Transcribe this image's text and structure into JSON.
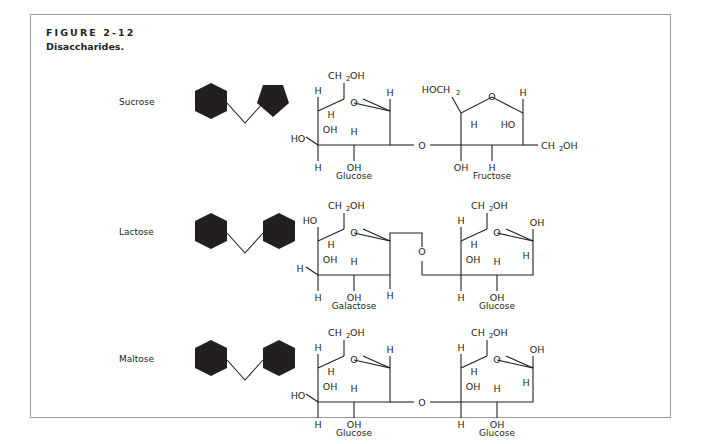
{
  "figure": {
    "number": "FIGURE 2-12",
    "caption": "Disaccharides.",
    "border_color": "#9a9a9a",
    "background": "#ffffff",
    "ink_color": "#231f20"
  },
  "rows": [
    {
      "name": "Sucrose",
      "icon": {
        "left_shape": "hexagon",
        "right_shape": "pentagon",
        "fill": "#231f20"
      },
      "left_sugar": {
        "label": "Glucose",
        "ring": "pyranose",
        "atoms": {
          "c6": "CH",
          "c6_sub": "2",
          "c6_tail": "OH",
          "ring_oxygen": "O",
          "top_left_h": "H",
          "inner_left_h": "H",
          "oh_upper": "OH",
          "ho_left": "HO",
          "bottom_left_h": "H",
          "bottom_oh": "OH",
          "inner_right_h": "H",
          "right_h": "H"
        }
      },
      "linkage": {
        "oxygen": "O",
        "style": "straight"
      },
      "right_sugar": {
        "label": "Fructose",
        "ring": "furanose",
        "atoms": {
          "c1": "HOCH",
          "c1_sub": "2",
          "ring_oxygen": "O",
          "top_right_h": "H",
          "inner_left_h": "H",
          "ho_inner": "HO",
          "bottom_oh": "OH",
          "bottom_h": "H",
          "c6": "CH",
          "c6_sub": "2",
          "c6_tail": "OH"
        }
      }
    },
    {
      "name": "Lactose",
      "icon": {
        "left_shape": "hexagon",
        "right_shape": "hexagon",
        "fill": "#231f20"
      },
      "left_sugar": {
        "label": "Galactose",
        "ring": "pyranose",
        "atoms": {
          "c6": "CH",
          "c6_sub": "2",
          "c6_tail": "OH",
          "ring_oxygen": "O",
          "ho_top_left": "HO",
          "inner_left_h": "H",
          "oh_upper": "OH",
          "h_left": "H",
          "bottom_left_h": "H",
          "bottom_oh": "OH",
          "inner_right_h": "H",
          "right_h": "H"
        }
      },
      "linkage": {
        "oxygen": "O",
        "style": "stepped"
      },
      "right_sugar": {
        "label": "Glucose",
        "ring": "pyranose",
        "atoms": {
          "c6": "CH",
          "c6_sub": "2",
          "c6_tail": "OH",
          "ring_oxygen": "O",
          "top_left_h": "H",
          "inner_left_h": "H",
          "oh_upper": "OH",
          "oh_right": "OH",
          "bottom_left_h": "H",
          "bottom_oh": "OH",
          "inner_right_h": "H",
          "right_h": "H"
        }
      }
    },
    {
      "name": "Maltose",
      "icon": {
        "left_shape": "hexagon",
        "right_shape": "hexagon",
        "fill": "#231f20"
      },
      "left_sugar": {
        "label": "Glucose",
        "ring": "pyranose",
        "atoms": {
          "c6": "CH",
          "c6_sub": "2",
          "c6_tail": "OH",
          "ring_oxygen": "O",
          "top_left_h": "H",
          "inner_left_h": "H",
          "oh_upper": "OH",
          "ho_left": "HO",
          "bottom_left_h": "H",
          "bottom_oh": "OH",
          "inner_right_h": "H",
          "right_h": "H"
        }
      },
      "linkage": {
        "oxygen": "O",
        "style": "straight"
      },
      "right_sugar": {
        "label": "Glucose",
        "ring": "pyranose",
        "atoms": {
          "c6": "CH",
          "c6_sub": "2",
          "c6_tail": "OH",
          "ring_oxygen": "O",
          "top_left_h": "H",
          "inner_left_h": "H",
          "oh_upper": "OH",
          "oh_right": "OH",
          "bottom_left_h": "H",
          "bottom_oh": "OH",
          "inner_right_h": "H",
          "right_h": "H"
        }
      }
    }
  ]
}
